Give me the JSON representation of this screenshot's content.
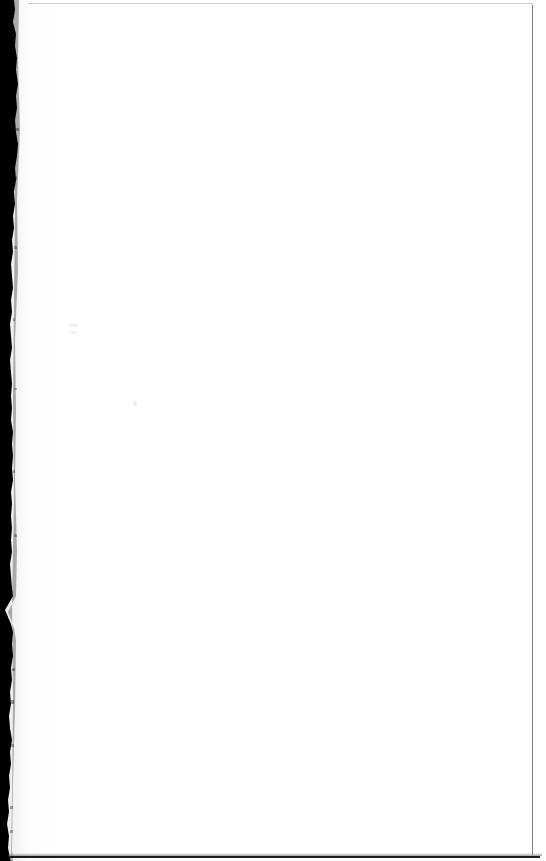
{
  "document": {
    "kind": "scanned-page",
    "state": "blank",
    "page_width_px": 546,
    "page_height_px": 861,
    "visible_text": "",
    "page_label": "",
    "description": "Blank scanned book page with dark binding gutter along the left edge"
  },
  "colors": {
    "paper": "#ffffff",
    "gutter_shadow": "#000000",
    "rule_line_right": "#5f5f62",
    "rule_line_top": "#969698",
    "rule_line_bottom": "#1b1b1c",
    "speck": "#78787d"
  },
  "regions": {
    "gutter": {
      "name": "binding-gutter",
      "edge": "left",
      "min_width_px": 9,
      "max_width_px": 19
    },
    "content_area": {
      "name": "page-content-area",
      "left_px": 28,
      "top_px": 4,
      "right_px": 532,
      "bottom_px": 855,
      "text": ""
    },
    "margins": {
      "top_rule_y_px": 3,
      "right_rule_x_px": 532,
      "bottom_rule_y_px": 856
    }
  },
  "artifacts": [
    {
      "name": "scan-speck",
      "x_px": 69,
      "y_px": 323
    },
    {
      "name": "scan-speck",
      "x_px": 70,
      "y_px": 331
    },
    {
      "name": "scan-speck",
      "x_px": 133,
      "y_px": 401
    }
  ]
}
